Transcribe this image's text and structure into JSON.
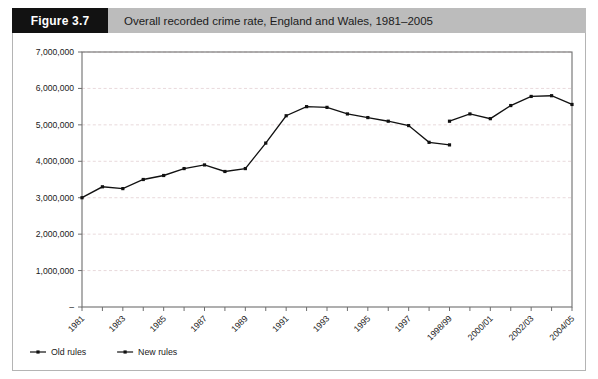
{
  "figure": {
    "tag": "Figure 3.7",
    "title": "Overall recorded crime rate, England and Wales, 1981–2005"
  },
  "chart_data": {
    "type": "line",
    "title": "Overall recorded crime rate, England and Wales, 1981–2005",
    "xlabel": "",
    "ylabel": "",
    "ylim": [
      0,
      7000000
    ],
    "ytick_labels": [
      "–",
      "1,000,000",
      "2,000,000",
      "3,000,000",
      "4,000,000",
      "5,000,000",
      "6,000,000",
      "7,000,000"
    ],
    "ytick_values": [
      0,
      1000000,
      2000000,
      3000000,
      4000000,
      5000000,
      6000000,
      7000000
    ],
    "grid": true,
    "legend_position": "bottom-left",
    "x": [
      "1981",
      "1982",
      "1983",
      "1984",
      "1985",
      "1986",
      "1987",
      "1988",
      "1989",
      "1990",
      "1991",
      "1992",
      "1993",
      "1994",
      "1995",
      "1996",
      "1997",
      "1997/98",
      "1998/99",
      "1999/00",
      "2000/01",
      "2001/02",
      "2002/03",
      "2003/04",
      "2004/05"
    ],
    "xtick_labels": [
      "1981",
      "1983",
      "1985",
      "1987",
      "1989",
      "1991",
      "1993",
      "1995",
      "1997",
      "1998/99",
      "2000/01",
      "2002/03",
      "2004/05"
    ],
    "xtick_indices": [
      0,
      2,
      4,
      6,
      8,
      10,
      12,
      14,
      16,
      18,
      20,
      22,
      24
    ],
    "series": [
      {
        "name": "Old rules",
        "color": "#111111",
        "points": [
          {
            "x": "1981",
            "xi": 0,
            "y": 3000000
          },
          {
            "x": "1982",
            "xi": 1,
            "y": 3300000
          },
          {
            "x": "1983",
            "xi": 2,
            "y": 3250000
          },
          {
            "x": "1984",
            "xi": 3,
            "y": 3500000
          },
          {
            "x": "1985",
            "xi": 4,
            "y": 3610000
          },
          {
            "x": "1986",
            "xi": 5,
            "y": 3800000
          },
          {
            "x": "1987",
            "xi": 6,
            "y": 3900000
          },
          {
            "x": "1988",
            "xi": 7,
            "y": 3720000
          },
          {
            "x": "1989",
            "xi": 8,
            "y": 3800000
          },
          {
            "x": "1990",
            "xi": 9,
            "y": 4500000
          },
          {
            "x": "1991",
            "xi": 10,
            "y": 5250000
          },
          {
            "x": "1992",
            "xi": 11,
            "y": 5500000
          },
          {
            "x": "1993",
            "xi": 12,
            "y": 5480000
          },
          {
            "x": "1994",
            "xi": 13,
            "y": 5300000
          },
          {
            "x": "1995",
            "xi": 14,
            "y": 5200000
          },
          {
            "x": "1996",
            "xi": 15,
            "y": 5100000
          },
          {
            "x": "1997",
            "xi": 16,
            "y": 4980000
          },
          {
            "x": "1997/98",
            "xi": 17,
            "y": 4520000
          },
          {
            "x": "1998/99",
            "xi": 18,
            "y": 4450000
          }
        ]
      },
      {
        "name": "New rules",
        "color": "#111111",
        "points": [
          {
            "x": "1998/99",
            "xi": 18,
            "y": 5100000
          },
          {
            "x": "1999/00",
            "xi": 19,
            "y": 5300000
          },
          {
            "x": "2000/01",
            "xi": 20,
            "y": 5170000
          },
          {
            "x": "2001/02",
            "xi": 21,
            "y": 5530000
          },
          {
            "x": "2002/03",
            "xi": 22,
            "y": 5780000
          },
          {
            "x": "2003/04",
            "xi": 23,
            "y": 5800000
          },
          {
            "x": "2004/05",
            "xi": 24,
            "y": 5560000
          }
        ]
      }
    ]
  },
  "legend": {
    "items": [
      {
        "label": "Old rules"
      },
      {
        "label": "New rules"
      }
    ]
  }
}
